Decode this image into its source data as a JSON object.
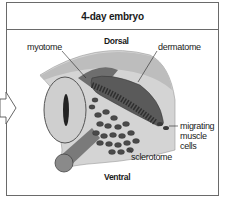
{
  "figure": {
    "title": "4-day embryo",
    "orientation": {
      "top": "Dorsal",
      "bottom": "Ventral"
    },
    "labels": {
      "myotome": "myotome",
      "dermatome": "dermatome",
      "migrating_muscle_cells": [
        "migrating",
        "muscle",
        "cells"
      ],
      "sclerotome": "sclerotome"
    },
    "icons": {
      "left_arrow": "hollow-right-arrow"
    },
    "colors": {
      "border": "#6a6a6a",
      "ectoderm": "#c9c9c9",
      "dermatome": "#5a5a5a",
      "neural_tube": "#b8b8b8",
      "cells": "#4a4a4a",
      "notochord": "#8a8a8a"
    }
  }
}
